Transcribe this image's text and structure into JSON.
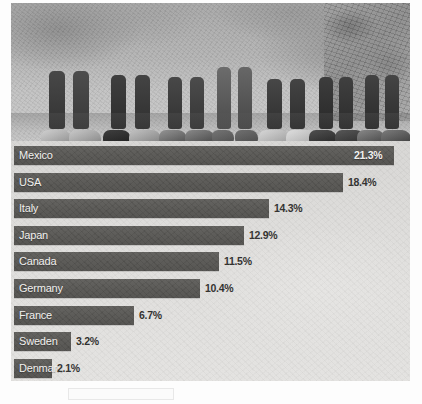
{
  "photo": {
    "alt_description": "Black and white photograph of a row of children's legs and feet standing on dusty ground next to a rock wall",
    "style": "grayscale"
  },
  "chart_data": {
    "type": "bar",
    "orientation": "horizontal",
    "title": "",
    "xlabel": "",
    "ylabel": "",
    "grid": false,
    "legend": null,
    "unit": "%",
    "axis_max_estimate": 22.0,
    "categories": [
      "Mexico",
      "USA",
      "Italy",
      "Japan",
      "Canada",
      "Germany",
      "France",
      "Sweden",
      "Denmark"
    ],
    "values": [
      21.3,
      18.4,
      14.3,
      12.9,
      11.5,
      10.4,
      6.7,
      3.2,
      2.1
    ],
    "value_labels": [
      "21.3%",
      "18.4%",
      "14.3%",
      "12.9%",
      "11.5%",
      "10.4%",
      "6.7%",
      "3.2%",
      "2.1%"
    ],
    "label_placement": [
      "inside-right",
      "outside-right",
      "outside-right",
      "outside-right",
      "outside-right",
      "outside-right",
      "outside-right",
      "outside-right",
      "outside-right"
    ],
    "bar_color": "#545350",
    "background_color": "#dddcda",
    "label_text_color": "#f2f1ef",
    "value_text_color": "#2c2b29"
  }
}
